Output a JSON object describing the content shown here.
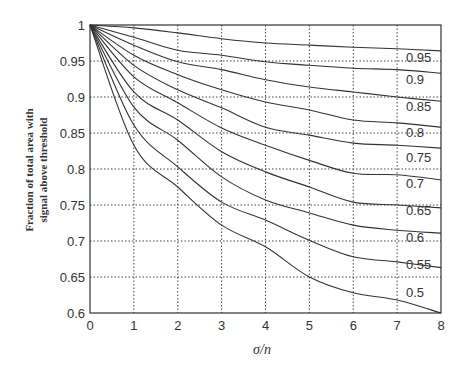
{
  "chart_data": {
    "type": "line",
    "title": "",
    "xlabel": "σ/n",
    "ylabel_lines": [
      "Fraction of total area with",
      "signal above threshold"
    ],
    "ylabel": "Fraction of total area with signal above threshold",
    "xlim": [
      0,
      8
    ],
    "ylim": [
      0.6,
      1
    ],
    "xticks": [
      "0",
      "1",
      "2",
      "3",
      "4",
      "5",
      "6",
      "7",
      "8"
    ],
    "yticks": [
      "0.6",
      "0.65",
      "0.7",
      "0.75",
      "0.8",
      "0.85",
      "0.9",
      "0.95",
      "1"
    ],
    "grid": true,
    "legend_position": "inline-right",
    "line_color": "#333333",
    "grid_color": "#444444",
    "x": [
      0,
      1,
      2,
      3,
      4,
      5,
      6,
      7,
      8
    ],
    "series": [
      {
        "name": "0.95",
        "values": [
          1.0,
          0.996,
          0.989,
          0.981,
          0.975,
          0.972,
          0.969,
          0.967,
          0.964
        ]
      },
      {
        "name": "0.9",
        "values": [
          1.0,
          0.983,
          0.965,
          0.958,
          0.949,
          0.944,
          0.94,
          0.938,
          0.933
        ]
      },
      {
        "name": "0.85",
        "values": [
          1.0,
          0.972,
          0.949,
          0.938,
          0.924,
          0.914,
          0.907,
          0.9,
          0.894
        ]
      },
      {
        "name": "0.8",
        "values": [
          1.0,
          0.958,
          0.931,
          0.91,
          0.893,
          0.882,
          0.868,
          0.864,
          0.858
        ]
      },
      {
        "name": "0.75",
        "values": [
          1.0,
          0.944,
          0.91,
          0.885,
          0.858,
          0.847,
          0.836,
          0.833,
          0.829
        ]
      },
      {
        "name": "0.7",
        "values": [
          1.0,
          0.928,
          0.892,
          0.857,
          0.833,
          0.812,
          0.794,
          0.792,
          0.785
        ]
      },
      {
        "name": "0.65",
        "values": [
          1.0,
          0.907,
          0.868,
          0.824,
          0.796,
          0.775,
          0.754,
          0.75,
          0.746
        ]
      },
      {
        "name": "0.6",
        "values": [
          1.0,
          0.886,
          0.84,
          0.789,
          0.757,
          0.739,
          0.722,
          0.715,
          0.711
        ]
      },
      {
        "name": "0.55",
        "values": [
          1.0,
          0.861,
          0.803,
          0.754,
          0.729,
          0.701,
          0.678,
          0.671,
          0.663
        ]
      },
      {
        "name": "0.5",
        "values": [
          1.0,
          0.833,
          0.775,
          0.722,
          0.692,
          0.65,
          0.628,
          0.618,
          0.6
        ]
      }
    ],
    "label_positions_y": [
      0.955,
      0.925,
      0.888,
      0.852,
      0.817,
      0.78,
      0.743,
      0.706,
      0.668,
      0.629
    ]
  }
}
